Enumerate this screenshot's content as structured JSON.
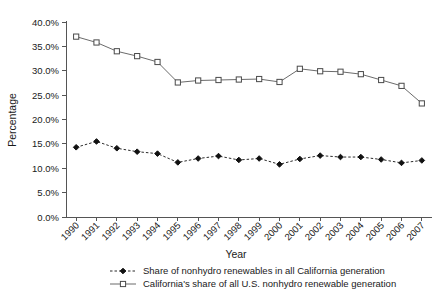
{
  "chart_data": {
    "type": "line",
    "title": "",
    "xlabel": "Year",
    "ylabel": "Percentage",
    "categories": [
      "1990",
      "1991",
      "1992",
      "1993",
      "1994",
      "1995",
      "1996",
      "1997",
      "1998",
      "1999",
      "2000",
      "2001",
      "2002",
      "2003",
      "2004",
      "2005",
      "2006",
      "2007"
    ],
    "x": [
      1990,
      1991,
      1992,
      1993,
      1994,
      1995,
      1996,
      1997,
      1998,
      1999,
      2000,
      2001,
      2002,
      2003,
      2004,
      2005,
      2006,
      2007
    ],
    "ylim": [
      0,
      40
    ],
    "yticks": [
      0,
      5,
      10,
      15,
      20,
      25,
      30,
      35,
      40
    ],
    "ytick_labels": [
      "0.0%",
      "5.0%",
      "10.0%",
      "15.0%",
      "20.0%",
      "25.0%",
      "30.0%",
      "35.0%",
      "40.0%"
    ],
    "grid": false,
    "legend_position": "below",
    "series": [
      {
        "name": "Share of nonhydro renewables in all California generation",
        "marker": "filled-diamond",
        "linestyle": "dashed",
        "color": "#2b2b2b",
        "values": [
          14.3,
          15.5,
          14.1,
          13.4,
          13.0,
          11.2,
          12.0,
          12.5,
          11.7,
          12.0,
          10.8,
          11.9,
          12.6,
          12.3,
          12.3,
          11.8,
          11.1,
          11.6
        ]
      },
      {
        "name": "California's share of all U.S. nonhydro renewable generation",
        "marker": "open-square",
        "linestyle": "solid",
        "color": "#6b6b6b",
        "values": [
          37.0,
          35.8,
          34.0,
          33.0,
          31.8,
          27.6,
          28.0,
          28.1,
          28.2,
          28.3,
          27.7,
          30.4,
          29.9,
          29.8,
          29.3,
          28.1,
          26.9,
          23.3
        ]
      }
    ]
  },
  "axis": {
    "ylabel": "Percentage",
    "xlabel": "Year"
  },
  "legend": {
    "entries": [
      {
        "label": "Share of nonhydro renewables in all California generation"
      },
      {
        "label": "California's share of all U.S. nonhydro renewable generation"
      }
    ]
  }
}
